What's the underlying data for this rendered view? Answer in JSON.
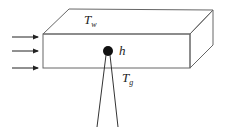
{
  "diagram": {
    "type": "heat-transfer-schematic",
    "labels": {
      "wall_temp": {
        "main": "T",
        "sub": "w"
      },
      "heat_coeff": {
        "main": "h"
      },
      "gas_temp": {
        "main": "T",
        "sub": "g"
      }
    },
    "flow_arrows": 3,
    "colors": {
      "line": "#555555",
      "probe": "#111111"
    }
  }
}
